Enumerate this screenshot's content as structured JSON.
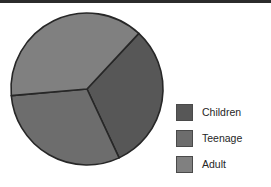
{
  "chart_data": {
    "type": "pie",
    "title": "",
    "subtitle": "",
    "xlabel": "",
    "ylabel": "",
    "grid": false,
    "legend_position": "right",
    "categories": [
      "Children",
      "Teenage",
      "Adult"
    ],
    "values": [
      31,
      30,
      39
    ],
    "units": "percent",
    "series": [
      {
        "name": "Age group share",
        "values": [
          31,
          30,
          39
        ]
      }
    ],
    "slices": [
      {
        "label": "Children",
        "value": 31,
        "percent": 31,
        "start_angle_deg": 43,
        "end_angle_deg": 155,
        "sweep_deg": 112,
        "color": "#575757"
      },
      {
        "label": "Teenage",
        "value": 30,
        "percent": 30,
        "start_angle_deg": 155,
        "end_angle_deg": 265,
        "sweep_deg": 110,
        "color": "#6d6d6d"
      },
      {
        "label": "Adult",
        "value": 39,
        "percent": 39,
        "start_angle_deg": 265,
        "end_angle_deg": 403,
        "sweep_deg": 138,
        "color": "#808080"
      }
    ],
    "geometry": {
      "center_x": 79,
      "center_y": 80,
      "radius": 76,
      "start_angle_reference": "clockwise-from-top"
    },
    "colors": {
      "children": "#575757",
      "teenage": "#6d6d6d",
      "adult": "#808080",
      "slice_outline": "#272727",
      "background": "#ffffff",
      "legend_text": "#262626",
      "top_rule": "#2b2b2b"
    }
  },
  "legend": {
    "items": [
      {
        "label": "Children",
        "swatch_icon": "color-swatch-icon"
      },
      {
        "label": "Teenage",
        "swatch_icon": "color-swatch-icon"
      },
      {
        "label": "Adult",
        "swatch_icon": "color-swatch-icon"
      }
    ]
  }
}
